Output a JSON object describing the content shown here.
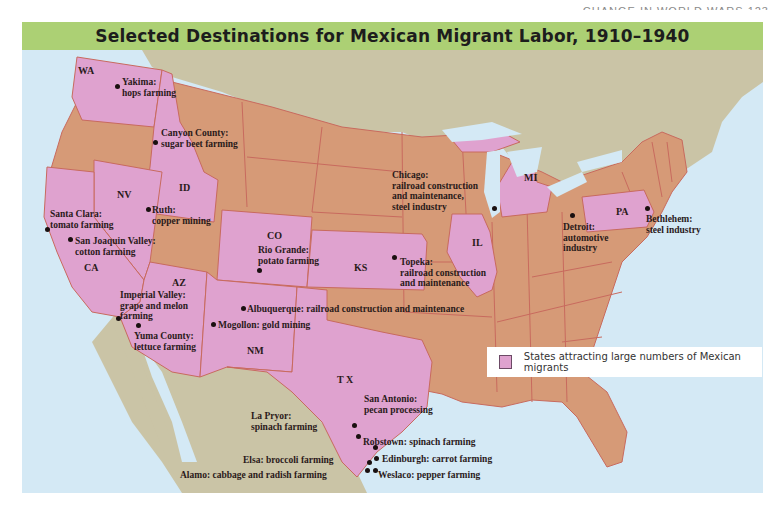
{
  "page": {
    "running_head": "CHANGE IN WORLD WARS 123"
  },
  "map": {
    "title": "Selected Destinations for Mexican Migrant Labor, 1910–1940",
    "colors": {
      "title_bar": "#acd074",
      "water": "#d4e9f5",
      "foreign_land": "#cac4a6",
      "state_default": "#d69a77",
      "state_highlighted": "#dfa2cf",
      "border": "#c86a5e"
    },
    "highlighted_states": [
      "WA",
      "ID",
      "NV",
      "CA",
      "AZ",
      "CO",
      "NM",
      "KS",
      "TX",
      "IL",
      "MI",
      "PA"
    ],
    "state_labels": {
      "WA": "WA",
      "ID": "ID",
      "NV": "NV",
      "CA": "CA",
      "AZ": "AZ",
      "CO": "CO",
      "NM": "NM",
      "KS": "KS",
      "TX": "T X",
      "IL": "IL",
      "MI": "MI",
      "PA": "PA"
    },
    "destinations": [
      {
        "name": "Yakima",
        "line1": "Yakima:",
        "line2": "hops farming"
      },
      {
        "name": "Canyon County",
        "line1": "Canyon County:",
        "line2": "sugar beet farming"
      },
      {
        "name": "Santa Clara",
        "line1": "Santa Clara:",
        "line2": "tomato farming"
      },
      {
        "name": "Ruth",
        "line1": "Ruth:",
        "line2": "copper mining"
      },
      {
        "name": "San Joaquin Valley",
        "line1": "San Joaquin Valley:",
        "line2": "cotton farming"
      },
      {
        "name": "Imperial Valley",
        "line1": "Imperial Valley:",
        "line2": "grape and melon",
        "line3": "farming"
      },
      {
        "name": "Yuma County",
        "line1": "Yuma County:",
        "line2": "lettuce farming"
      },
      {
        "name": "Rio Grande",
        "line1": "Rio Grande:",
        "line2": "potato farming"
      },
      {
        "name": "Albuquerque",
        "line1": "Albuquerque: railroad construction and maintenance"
      },
      {
        "name": "Mogollon",
        "line1": "Mogollon: gold mining"
      },
      {
        "name": "Topeka",
        "line1": "Topeka:",
        "line2": "railroad construction",
        "line3": "and maintenance"
      },
      {
        "name": "Chicago",
        "line1": "Chicago:",
        "line2": "railroad construction",
        "line3": "and maintenance,",
        "line4": "steel industry"
      },
      {
        "name": "Detroit",
        "line1": "Detroit:",
        "line2": "automotive",
        "line3": "industry"
      },
      {
        "name": "Bethlehem",
        "line1": "Bethlehem:",
        "line2": "steel industry"
      },
      {
        "name": "San Antonio",
        "line1": "San Antonio:",
        "line2": "pecan processing"
      },
      {
        "name": "La Pryor",
        "line1": "La Pryor:",
        "line2": "spinach farming"
      },
      {
        "name": "Robstown",
        "line1": "Robstown: spinach farming"
      },
      {
        "name": "Elsa",
        "line1": "Elsa: broccoli farming"
      },
      {
        "name": "Edinburgh",
        "line1": "Edinburgh: carrot farming"
      },
      {
        "name": "Alamo",
        "line1": "Alamo: cabbage and radish farming"
      },
      {
        "name": "Weslaco",
        "line1": "Weslaco: pepper farming"
      }
    ],
    "legend": {
      "swatch_color": "#dfa2cf",
      "label": "States attracting large numbers of Mexican migrants"
    }
  }
}
